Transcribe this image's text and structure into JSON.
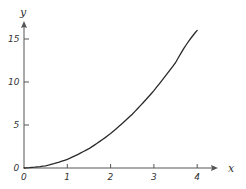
{
  "chart_data": {
    "type": "line",
    "title": "",
    "xlabel": "x",
    "ylabel": "y",
    "xlim": [
      0,
      4.5
    ],
    "ylim": [
      0,
      17.5
    ],
    "grid": false,
    "legend": null,
    "x_ticks": [
      0,
      1,
      2,
      3,
      4
    ],
    "x_tick_labels": [
      "0",
      "1",
      "2",
      "3",
      "4"
    ],
    "y_ticks": [
      0,
      5,
      10,
      15
    ],
    "y_tick_labels": [
      "0",
      "5",
      "10",
      "15"
    ],
    "series": [
      {
        "name": "y = x^2",
        "x": [
          0,
          0.5,
          1,
          1.5,
          2,
          2.5,
          3,
          3.5,
          4
        ],
        "y": [
          0,
          0.25,
          1,
          2.25,
          4,
          6.25,
          9,
          12.25,
          16
        ]
      }
    ],
    "colors": {
      "curve": "#2a2a2a",
      "axis": "#555555"
    }
  }
}
